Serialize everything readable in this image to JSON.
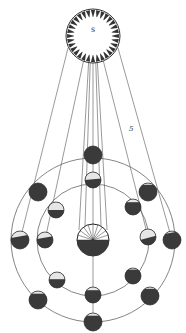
{
  "diagram": {
    "sun": {
      "label": "S",
      "cx": 93,
      "cy": 36,
      "r": 27
    },
    "earth": {
      "cx": 93,
      "cy": 240,
      "r": 16
    },
    "figure_number": "5",
    "orbits": [
      {
        "name": "inner",
        "r": 56
      },
      {
        "name": "outer",
        "r": 82
      }
    ],
    "colors": {
      "ink": "#2a2a2a",
      "dark_side": "#3a3a3a",
      "lit_side": "#e8e8e8",
      "line": "#555555",
      "background": "#ffffff"
    }
  }
}
